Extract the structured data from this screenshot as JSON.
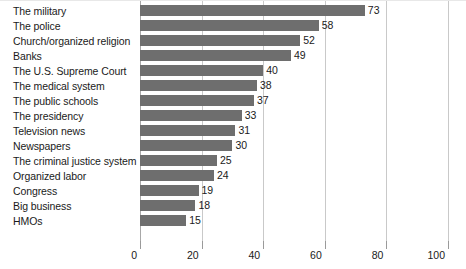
{
  "chart_data": {
    "type": "bar",
    "orientation": "horizontal",
    "title": "",
    "subtitle": "",
    "xlabel": "",
    "ylabel": "",
    "xlim": [
      0,
      100
    ],
    "xticks": [
      0,
      20,
      40,
      60,
      80,
      100
    ],
    "xtick_labels": [
      "0",
      "20",
      "40",
      "60",
      "80",
      "100"
    ],
    "grid": true,
    "grid_axis": "x",
    "legend": false,
    "legend_position": "none",
    "bar_color": "#6e6e6e",
    "gridline_color": "#c9c9c9",
    "text_color": "#1a1a1a",
    "value_labels": true,
    "categories": [
      "The military",
      "The police",
      "Church/organized religion",
      "Banks",
      "The U.S. Supreme Court",
      "The medical system",
      "The public schools",
      "The presidency",
      "Television news",
      "Newspapers",
      "The criminal justice system",
      "Organized labor",
      "Congress",
      "Big business",
      "HMOs"
    ],
    "values": [
      73,
      58,
      52,
      49,
      40,
      38,
      37,
      33,
      31,
      30,
      25,
      24,
      19,
      18,
      15
    ],
    "value_labels_text": [
      "73",
      "58",
      "52",
      "49",
      "40",
      "38",
      "37",
      "33",
      "31",
      "30",
      "25",
      "24",
      "19",
      "18",
      "15"
    ]
  }
}
